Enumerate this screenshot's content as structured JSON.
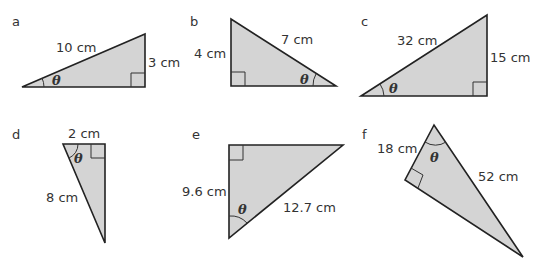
{
  "angle_symbol": "θ",
  "colors": {
    "fill": "#d4d4d4",
    "stroke": "#222222",
    "text": "#333333"
  },
  "triangles": [
    {
      "id": "a",
      "label": "a",
      "hypotenuse": "10 cm",
      "side": "3 cm"
    },
    {
      "id": "b",
      "label": "b",
      "side": "4 cm",
      "hypotenuse": "7 cm"
    },
    {
      "id": "c",
      "label": "c",
      "hypotenuse": "32 cm",
      "side": "15 cm"
    },
    {
      "id": "d",
      "label": "d",
      "side": "2 cm",
      "hypotenuse": "8 cm"
    },
    {
      "id": "e",
      "label": "e",
      "side": "9.6 cm",
      "hypotenuse": "12.7 cm"
    },
    {
      "id": "f",
      "label": "f",
      "side": "18 cm",
      "hypotenuse": "52 cm"
    }
  ]
}
